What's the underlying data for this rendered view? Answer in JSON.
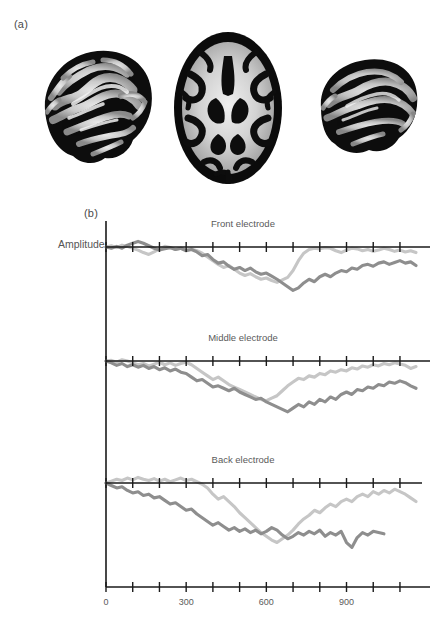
{
  "figure": {
    "panel_a_label": "(a)",
    "panel_b_label": "(b)",
    "y_axis_label": "Amplitude"
  },
  "brain_images": {
    "type": "mri-grayscale",
    "items": [
      {
        "name": "sagittal-left",
        "view": "sagittal"
      },
      {
        "name": "axial-middle",
        "view": "axial"
      },
      {
        "name": "sagittal-right",
        "view": "sagittal"
      }
    ]
  },
  "chart_data": {
    "type": "line",
    "title": "",
    "xlabel": "",
    "ylabel": "Amplitude",
    "xlim": [
      0,
      1175
    ],
    "tick_interval": 100,
    "xticks": [
      0,
      100,
      200,
      300,
      400,
      500,
      600,
      700,
      800,
      900,
      1000,
      1100
    ],
    "xticklabels": [
      "0",
      "",
      "",
      "300",
      "",
      "",
      "600",
      "",
      "",
      "900",
      "",
      ""
    ],
    "grid": false,
    "legend": "none",
    "axis_color": "#1a1a1a",
    "series_colors": {
      "light": "#c6c6c6",
      "dark": "#8e8e8e"
    },
    "panels": [
      {
        "name": "front",
        "label": "Front electrode",
        "series": [
          {
            "name": "light-trace",
            "color": "#c6c6c6",
            "x": [
              0,
              20,
              40,
              60,
              80,
              100,
              120,
              140,
              160,
              180,
              200,
              220,
              240,
              260,
              280,
              300,
              320,
              340,
              360,
              380,
              400,
              420,
              440,
              460,
              480,
              500,
              520,
              540,
              560,
              580,
              600,
              620,
              640,
              660,
              680,
              700,
              720,
              740,
              760,
              780,
              800,
              820,
              840,
              860,
              880,
              900,
              920,
              940,
              960,
              980,
              1000,
              1020,
              1040,
              1060,
              1080,
              1100,
              1120,
              1140,
              1160
            ],
            "y": [
              0,
              2,
              -1,
              3,
              1,
              -2,
              -5,
              -9,
              -12,
              -8,
              -3,
              1,
              -1,
              -4,
              -2,
              -5,
              -3,
              -6,
              -10,
              -16,
              -22,
              -28,
              -33,
              -30,
              -36,
              -42,
              -46,
              -43,
              -48,
              -52,
              -50,
              -54,
              -57,
              -53,
              -49,
              -38,
              -22,
              -10,
              -4,
              -2,
              -3,
              -1,
              -2,
              -6,
              -9,
              -5,
              -2,
              -3,
              -6,
              -4,
              -7,
              -5,
              -2,
              -4,
              -7,
              -5,
              -8,
              -6,
              -9
            ]
          },
          {
            "name": "dark-trace",
            "color": "#8e8e8e",
            "x": [
              0,
              20,
              40,
              60,
              80,
              100,
              120,
              140,
              160,
              180,
              200,
              220,
              240,
              260,
              280,
              300,
              320,
              340,
              360,
              380,
              400,
              420,
              440,
              460,
              480,
              500,
              520,
              540,
              560,
              580,
              600,
              620,
              640,
              660,
              680,
              700,
              720,
              740,
              760,
              780,
              800,
              820,
              840,
              860,
              880,
              900,
              920,
              940,
              960,
              980,
              1000,
              1020,
              1040,
              1060,
              1080,
              1100,
              1120,
              1140,
              1160
            ],
            "y": [
              0,
              -2,
              1,
              -2,
              3,
              6,
              9,
              6,
              2,
              -2,
              -5,
              -3,
              -1,
              -4,
              -2,
              -6,
              -4,
              -8,
              -14,
              -12,
              -20,
              -26,
              -24,
              -31,
              -36,
              -33,
              -38,
              -34,
              -40,
              -44,
              -42,
              -47,
              -52,
              -58,
              -64,
              -70,
              -66,
              -58,
              -52,
              -56,
              -48,
              -44,
              -48,
              -42,
              -38,
              -40,
              -34,
              -36,
              -30,
              -28,
              -31,
              -26,
              -24,
              -28,
              -25,
              -22,
              -26,
              -24,
              -30
            ]
          }
        ]
      },
      {
        "name": "middle",
        "label": "Middle electrode",
        "series": [
          {
            "name": "light-trace",
            "color": "#c6c6c6",
            "x": [
              0,
              20,
              40,
              60,
              80,
              100,
              120,
              140,
              160,
              180,
              200,
              220,
              240,
              260,
              280,
              300,
              320,
              340,
              360,
              380,
              400,
              420,
              440,
              460,
              480,
              500,
              520,
              540,
              560,
              580,
              600,
              620,
              640,
              660,
              680,
              700,
              720,
              740,
              760,
              780,
              800,
              820,
              840,
              860,
              880,
              900,
              920,
              940,
              960,
              980,
              1000,
              1020,
              1040,
              1060,
              1080,
              1100,
              1120,
              1140,
              1160
            ],
            "y": [
              0,
              1,
              -2,
              2,
              0,
              -3,
              -6,
              -4,
              -8,
              -5,
              -2,
              -6,
              -3,
              -7,
              -4,
              -2,
              -6,
              -12,
              -18,
              -24,
              -30,
              -26,
              -32,
              -38,
              -42,
              -46,
              -50,
              -54,
              -58,
              -62,
              -64,
              -60,
              -56,
              -48,
              -40,
              -34,
              -28,
              -30,
              -24,
              -26,
              -20,
              -22,
              -16,
              -18,
              -14,
              -16,
              -11,
              -13,
              -8,
              -10,
              -6,
              -8,
              -4,
              -6,
              -3,
              -5,
              -7,
              -12,
              -9
            ]
          },
          {
            "name": "dark-trace",
            "color": "#8e8e8e",
            "x": [
              0,
              20,
              40,
              60,
              80,
              100,
              120,
              140,
              160,
              180,
              200,
              220,
              240,
              260,
              280,
              300,
              320,
              340,
              360,
              380,
              400,
              420,
              440,
              460,
              480,
              500,
              520,
              540,
              560,
              580,
              600,
              620,
              640,
              660,
              680,
              700,
              720,
              740,
              760,
              780,
              800,
              820,
              840,
              860,
              880,
              900,
              920,
              940,
              960,
              980,
              1000,
              1020,
              1040,
              1060,
              1080,
              1100,
              1120,
              1140,
              1160
            ],
            "y": [
              0,
              -3,
              -7,
              -4,
              -9,
              -6,
              -10,
              -7,
              -12,
              -9,
              -14,
              -11,
              -16,
              -13,
              -18,
              -20,
              -26,
              -32,
              -30,
              -36,
              -42,
              -40,
              -44,
              -48,
              -44,
              -50,
              -54,
              -58,
              -62,
              -60,
              -66,
              -70,
              -74,
              -78,
              -82,
              -76,
              -70,
              -74,
              -66,
              -70,
              -62,
              -66,
              -58,
              -62,
              -54,
              -50,
              -54,
              -46,
              -48,
              -42,
              -44,
              -38,
              -40,
              -34,
              -36,
              -32,
              -35,
              -40,
              -44
            ]
          }
        ]
      },
      {
        "name": "back",
        "label": "Back electrode",
        "series": [
          {
            "name": "light-trace",
            "color": "#c6c6c6",
            "x": [
              0,
              20,
              40,
              60,
              80,
              100,
              120,
              140,
              160,
              180,
              200,
              220,
              240,
              260,
              280,
              300,
              320,
              340,
              360,
              380,
              400,
              420,
              440,
              460,
              480,
              500,
              520,
              540,
              560,
              580,
              600,
              620,
              640,
              660,
              680,
              700,
              720,
              740,
              760,
              780,
              800,
              820,
              840,
              860,
              880,
              900,
              920,
              940,
              960,
              980,
              1000,
              1020,
              1040,
              1060,
              1080,
              1100,
              1120,
              1140,
              1160
            ],
            "y": [
              0,
              3,
              6,
              4,
              8,
              5,
              9,
              6,
              4,
              7,
              3,
              6,
              2,
              5,
              8,
              4,
              6,
              2,
              -2,
              -8,
              -18,
              -26,
              -22,
              -30,
              -38,
              -48,
              -56,
              -64,
              -72,
              -80,
              -86,
              -92,
              -96,
              -90,
              -84,
              -76,
              -66,
              -58,
              -52,
              -44,
              -48,
              -40,
              -34,
              -38,
              -30,
              -26,
              -30,
              -22,
              -18,
              -22,
              -14,
              -18,
              -12,
              -16,
              -10,
              -14,
              -18,
              -24,
              -30
            ]
          },
          {
            "name": "dark-trace",
            "color": "#8e8e8e",
            "x": [
              0,
              20,
              40,
              60,
              80,
              100,
              120,
              140,
              160,
              180,
              200,
              220,
              240,
              260,
              280,
              300,
              320,
              340,
              360,
              380,
              400,
              420,
              440,
              460,
              480,
              500,
              520,
              540,
              560,
              580,
              600,
              620,
              640,
              660,
              680,
              700,
              720,
              740,
              760,
              780,
              800,
              820,
              840,
              860,
              880,
              900,
              920,
              940,
              960,
              980,
              1000,
              1020,
              1040
            ],
            "y": [
              0,
              -4,
              -8,
              -6,
              -12,
              -16,
              -14,
              -20,
              -18,
              -24,
              -22,
              -28,
              -34,
              -32,
              -38,
              -44,
              -42,
              -50,
              -56,
              -62,
              -68,
              -64,
              -70,
              -76,
              -72,
              -78,
              -74,
              -80,
              -76,
              -82,
              -78,
              -72,
              -76,
              -84,
              -90,
              -86,
              -80,
              -84,
              -78,
              -82,
              -76,
              -86,
              -80,
              -84,
              -78,
              -96,
              -104,
              -88,
              -80,
              -84,
              -78,
              -80,
              -82
            ]
          }
        ]
      }
    ]
  }
}
